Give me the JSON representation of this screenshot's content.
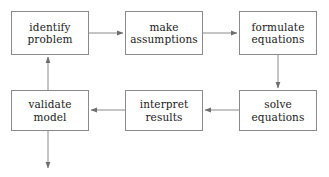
{
  "diagram": {
    "type": "flowchart",
    "background_color": "#ffffff",
    "line_color": "#8a8a8a",
    "text_color": "#1a1a1a",
    "nodes": [
      {
        "id": "identify-problem",
        "line1": "identify",
        "line2": "problem"
      },
      {
        "id": "make-assumptions",
        "line1": "make",
        "line2": "assumptions"
      },
      {
        "id": "formulate-equations",
        "line1": "formulate",
        "line2": "equations"
      },
      {
        "id": "validate-model",
        "line1": "validate",
        "line2": "model"
      },
      {
        "id": "interpret-results",
        "line1": "interpret",
        "line2": "results"
      },
      {
        "id": "solve-equations",
        "line1": "solve",
        "line2": "equations"
      }
    ],
    "edges": [
      {
        "id": "identify-problem-to-make-assumptions",
        "direction": "right"
      },
      {
        "id": "make-assumptions-to-formulate-equations",
        "direction": "right"
      },
      {
        "id": "formulate-equations-to-solve-equations",
        "direction": "down"
      },
      {
        "id": "solve-equations-to-interpret-results",
        "direction": "left"
      },
      {
        "id": "interpret-results-to-validate-model",
        "direction": "left"
      },
      {
        "id": "validate-model-to-identify-problem",
        "direction": "up"
      },
      {
        "id": "validate-model-output",
        "direction": "down"
      }
    ]
  }
}
